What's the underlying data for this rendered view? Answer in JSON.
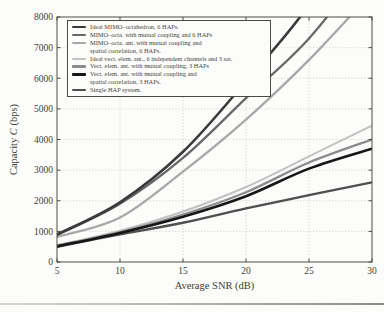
{
  "labels": {
    "xlabel": "Average SNR (dB)",
    "ylabel_pre": "Capacity ",
    "ylabel_var": "C",
    "ylabel_post": " (bps)"
  },
  "chart_data": {
    "type": "line",
    "title": "",
    "xlabel": "Average SNR (dB)",
    "ylabel": "Capacity C (bps)",
    "xlim": [
      5,
      30
    ],
    "ylim": [
      0,
      8000
    ],
    "xticks": [
      5,
      10,
      15,
      20,
      25,
      30
    ],
    "yticks": [
      0,
      1000,
      2000,
      3000,
      4000,
      5000,
      6000,
      7000,
      8000
    ],
    "grid": "dotted",
    "legend_position": "upper-left",
    "x": [
      5,
      10,
      15,
      20,
      25,
      30
    ],
    "series": [
      {
        "name": "Ideal MIMO–octahedron, 6 HAPs.",
        "legend_lines": [
          "Ideal MIMO–octahedron, 6 HAPs."
        ],
        "color": "#3a3a3a",
        "width": 2.6,
        "values": [
          900,
          1950,
          3600,
          5900,
          8400,
          11800
        ]
      },
      {
        "name": "MIMO–octa. with mutual coupling and 6 HAPs",
        "legend_lines": [
          "MIMO–octa. with mutual coupling and 6 HAPs"
        ],
        "color": "#686868",
        "width": 2.3,
        "values": [
          880,
          1900,
          3400,
          5350,
          7300,
          9900
        ]
      },
      {
        "name": "MIMO–octa. ant. with mutual coupling and spatial correlation, 6 HAPs.",
        "legend_lines": [
          "MIMO–octa. ant. with mutual coupling and",
          "spatial correlation, 6 HAPs."
        ],
        "color": "#a8a8a8",
        "width": 2.3,
        "values": [
          820,
          1450,
          2950,
          4650,
          6600,
          8800
        ]
      },
      {
        "name": "Ideal vect. elem. ant., 6 independent channels and 3 sat.",
        "legend_lines": [
          "Ideal vect. elem. ant., 6 independent channels and 3 sat."
        ],
        "color": "#c2c2c2",
        "width": 2.0,
        "values": [
          550,
          1020,
          1650,
          2450,
          3450,
          4450
        ]
      },
      {
        "name": "Vect. elem. ant. with mutual coupling, 3 HAPs",
        "legend_lines": [
          "Vect. elem. ant. with mutual coupling, 3 HAPs"
        ],
        "color": "#8c8c8c",
        "width": 2.3,
        "values": [
          530,
          980,
          1550,
          2280,
          3250,
          4000
        ]
      },
      {
        "name": "Vect. elem. ant. with mutual coupling and spatial correlation, 3 HAPs.",
        "legend_lines": [
          "Vect. elem. ant. with mutual coupling and",
          "spatial correlation, 3 HAPs."
        ],
        "color": "#161616",
        "width": 2.6,
        "values": [
          510,
          950,
          1480,
          2150,
          3050,
          3700
        ]
      },
      {
        "name": "Single HAP system.",
        "legend_lines": [
          "Single HAP system."
        ],
        "color": "#4f4f4f",
        "width": 2.4,
        "values": [
          500,
          900,
          1280,
          1750,
          2180,
          2600
        ]
      }
    ]
  }
}
